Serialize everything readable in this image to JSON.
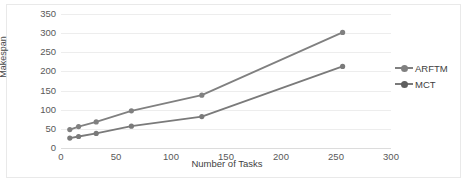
{
  "chart_data": {
    "type": "line",
    "title": "",
    "xlabel": "Number of Tasks",
    "ylabel": "Makespan",
    "xlim": [
      0,
      300
    ],
    "ylim": [
      0,
      350
    ],
    "xticks": [
      0,
      50,
      100,
      150,
      200,
      250,
      300
    ],
    "yticks": [
      0,
      50,
      100,
      150,
      200,
      250,
      300,
      350
    ],
    "grid": true,
    "legend_position": "right",
    "x": [
      8,
      16,
      32,
      64,
      128,
      256
    ],
    "series": [
      {
        "name": "ARFTM",
        "color": "#808080",
        "values": [
          48,
          56,
          68,
          97,
          138,
          302
        ]
      },
      {
        "name": "MCT",
        "color": "#7a7a7a",
        "values": [
          26,
          30,
          38,
          57,
          82,
          213
        ]
      }
    ]
  },
  "legend": {
    "items": [
      {
        "label": "ARFTM"
      },
      {
        "label": "MCT"
      }
    ]
  },
  "axes": {
    "y_title": "Makespan",
    "x_title": "Number of Tasks",
    "y_tick_labels": [
      "350",
      "300",
      "250",
      "200",
      "150",
      "100",
      "50",
      "0"
    ],
    "x_tick_labels": [
      "0",
      "50",
      "100",
      "150",
      "200",
      "250",
      "300"
    ]
  },
  "colors": {
    "series_line": "#808080",
    "gridline": "#ededed",
    "tick_text": "#595959",
    "axis_title": "#3f3f3f",
    "frame": "#e9e9e9"
  }
}
